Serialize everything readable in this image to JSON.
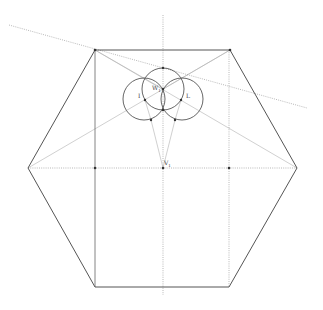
{
  "diagram": {
    "type": "geometric-construction",
    "background": "#ffffff",
    "colors": {
      "solid_line": "#555555",
      "construction_line": "#aaaaaa",
      "dotted_line": "#999999",
      "point": "#333333",
      "circle": "#555555"
    },
    "hexagon": {
      "vertices": [
        [
          95,
          50
        ],
        [
          230,
          50
        ],
        [
          297,
          168
        ],
        [
          229,
          287
        ],
        [
          95,
          287
        ],
        [
          28,
          168
        ]
      ]
    },
    "inner_rectangle_verticals": [
      {
        "x": 95,
        "y1": 50,
        "y2": 287
      },
      {
        "x": 229,
        "y1": 50,
        "y2": 287
      }
    ],
    "axes": {
      "vertical": {
        "x": 163,
        "y1": 15,
        "y2": 295
      },
      "horizontal": {
        "y": 168,
        "x1": 28,
        "x2": 297
      }
    },
    "slanted_dotted_line": {
      "x1": 9,
      "y1": 25,
      "x2": 307,
      "y2": 108
    },
    "circles": [
      {
        "name": "center",
        "cx": 163,
        "cy": 89,
        "r": 21
      },
      {
        "name": "left",
        "cx": 144,
        "cy": 99,
        "r": 21
      },
      {
        "name": "right",
        "cx": 182,
        "cy": 99,
        "r": 21
      }
    ],
    "points": [
      {
        "name": "top-left",
        "x": 95,
        "y": 50
      },
      {
        "name": "top-right",
        "x": 230,
        "y": 50
      },
      {
        "name": "mid-left",
        "x": 95,
        "y": 168
      },
      {
        "name": "center",
        "x": 163,
        "y": 168
      },
      {
        "name": "mid-right",
        "x": 229,
        "y": 168
      },
      {
        "name": "circle-top",
        "x": 163,
        "y": 68
      },
      {
        "name": "w1",
        "x": 163,
        "y": 89
      },
      {
        "name": "i",
        "x": 145,
        "y": 100
      },
      {
        "name": "l",
        "x": 181,
        "y": 100
      },
      {
        "name": "circle-bottom",
        "x": 163,
        "y": 110
      },
      {
        "name": "bottom-left",
        "x": 151,
        "y": 120
      },
      {
        "name": "bottom-right",
        "x": 175,
        "y": 120
      }
    ],
    "labels": {
      "w": "W",
      "w_sub": "1",
      "i": "I",
      "l": "L",
      "v": "V",
      "v_sub": "1"
    }
  }
}
